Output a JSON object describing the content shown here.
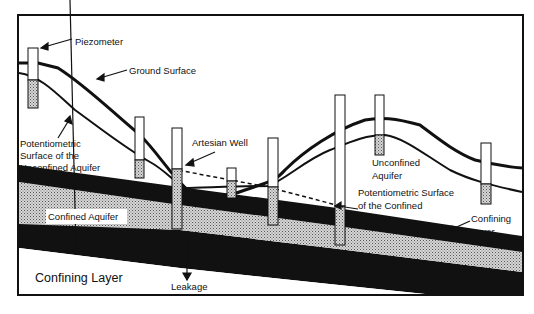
{
  "diagram": {
    "type": "hydrogeologic cross-section",
    "colors": {
      "background": "#ffffff",
      "line": "#111111",
      "aquifer_fill": "#c8c8c8",
      "confining_fill": "#111111"
    },
    "labels": {
      "piezometer": "Piezometer",
      "ground_surface": "Ground Surface",
      "pot_unconfined_1": "Potentiometric",
      "pot_unconfined_2": "Surface of the",
      "pot_unconfined_3": "Unconfined Aquifer",
      "artesian_well": "Artesian Well",
      "unconfined_aquifer_1": "Unconfined",
      "unconfined_aquifer_2": "Aquifer",
      "pot_confined_1": "Potentiometric  Surface",
      "pot_confined_2": "of the Confined",
      "pot_confined_3": "Aquifer",
      "confined_aquifer": "Confined Aquifer",
      "confining_layer_right_1": "Confining",
      "confining_layer_right_2": "Layer",
      "confining_layer_left": "Confining Layer",
      "leakage": "Leakage"
    },
    "wells": [
      {
        "id": "piezometer-1",
        "x": 28,
        "top": 48,
        "bottom": 108,
        "water": 80
      },
      {
        "id": "piezometer-2",
        "x": 135,
        "top": 117,
        "bottom": 178,
        "water": 160
      },
      {
        "id": "artesian-well",
        "x": 172,
        "top": 128,
        "bottom": 229,
        "water": 169
      },
      {
        "id": "piezometer-3",
        "x": 227,
        "top": 168,
        "bottom": 198,
        "water": 181
      },
      {
        "id": "piezometer-4",
        "x": 268,
        "top": 138,
        "bottom": 225,
        "water": 187
      },
      {
        "id": "piezometer-5",
        "x": 335,
        "top": 95,
        "bottom": 245,
        "water": 206
      },
      {
        "id": "piezometer-6",
        "x": 375,
        "top": 95,
        "bottom": 155,
        "water": 135
      },
      {
        "id": "piezometer-7",
        "x": 481,
        "top": 143,
        "bottom": 204,
        "water": 184
      }
    ]
  }
}
